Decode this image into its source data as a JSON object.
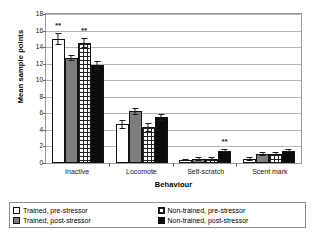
{
  "chart_data": {
    "type": "bar",
    "title": "",
    "xlabel": "Behaviour",
    "ylabel": "Mean sample points",
    "ylim": [
      0,
      18
    ],
    "yticks": [
      0,
      2,
      4,
      6,
      8,
      10,
      12,
      14,
      16,
      18
    ],
    "grid": true,
    "legend_position": "bottom",
    "categories": [
      "Inactive",
      "Locomote",
      "Self-scratch",
      "Scent mark"
    ],
    "series": [
      {
        "name": "Trained, pre-stressor",
        "key": "s-tp",
        "color": "#ffffff",
        "values": [
          15.0,
          4.7,
          0.35,
          0.5
        ],
        "errors": [
          0.7,
          0.55,
          0.15,
          0.2
        ]
      },
      {
        "name": "Trained, post-stressor",
        "key": "s-ts",
        "color": "#7d7d7d",
        "values": [
          12.65,
          6.25,
          0.5,
          1.05
        ],
        "errors": [
          0.35,
          0.45,
          0.2,
          0.25
        ]
      },
      {
        "name": "Non-trained, pre-stressor",
        "key": "s-np",
        "color": "#ffffff",
        "values": [
          14.55,
          4.3,
          0.5,
          1.1
        ],
        "errors": [
          0.6,
          0.5,
          0.2,
          0.25
        ]
      },
      {
        "name": "Non-trained, post-stressor",
        "key": "s-ns",
        "color": "#0c0c0c",
        "values": [
          11.8,
          5.5,
          1.5,
          1.5
        ],
        "errors": [
          0.55,
          0.4,
          0.2,
          0.2
        ]
      }
    ],
    "annotations": [
      {
        "label": "**",
        "category": "Inactive",
        "series": "Trained, pre-stressor",
        "group_index": 0,
        "bar_index": 0
      },
      {
        "label": "**",
        "category": "Inactive",
        "series": "Non-trained, pre-stressor",
        "group_index": 0,
        "bar_index": 2
      },
      {
        "label": "**",
        "category": "Self-scratch",
        "series": "Non-trained, post-stressor",
        "group_index": 2,
        "bar_index": 3
      }
    ]
  }
}
